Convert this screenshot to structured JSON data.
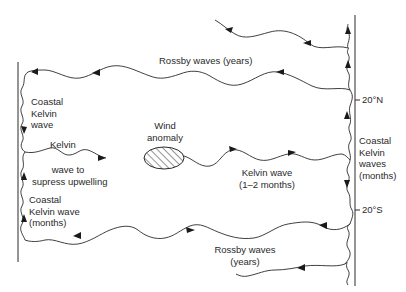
{
  "diagram": {
    "type": "equatorial-ocean-wave-schematic",
    "colors": {
      "ink": "#2a2a2a",
      "background": "#ffffff"
    },
    "latitude_ticks": [
      {
        "label": "20°N"
      },
      {
        "label": "20°S"
      }
    ],
    "labels": {
      "rossby_north": "Rossby waves  (years)",
      "rossby_south_line1": "Rossby waves",
      "rossby_south_line2": "(years)",
      "coastal_kelvin_west_north_line1": "Coastal",
      "coastal_kelvin_west_north_line2": "Kelvin",
      "coastal_kelvin_west_north_line3": "wave",
      "kelvin_west_line1": "Kelvin",
      "kelvin_west_line2": "wave to",
      "kelvin_west_line3": "supress upwelling",
      "coastal_kelvin_west_south_line1": "Coastal",
      "coastal_kelvin_west_south_line2": "Kelvin wave",
      "coastal_kelvin_west_south_line3": "(months)",
      "wind_anomaly_line1": "Wind",
      "wind_anomaly_line2": "anomaly",
      "kelvin_east_line1": "Kelvin wave",
      "kelvin_east_line2": "(1–2 months)",
      "coastal_kelvin_east_line1": "Coastal",
      "coastal_kelvin_east_line2": "Kelvin",
      "coastal_kelvin_east_line3": "waves",
      "coastal_kelvin_east_line4": "(months)"
    }
  }
}
